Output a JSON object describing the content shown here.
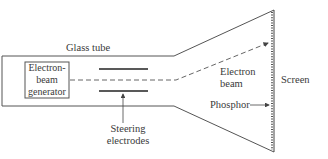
{
  "diagram": {
    "labels": {
      "glass_tube": "Glass tube",
      "generator_line1": "Electron-",
      "generator_line2": "beam",
      "generator_line3": "generator",
      "steering_line1": "Steering",
      "steering_line2": "electrodes",
      "beam_line1": "Electron",
      "beam_line2": "beam",
      "screen": "Screen",
      "phosphor": "Phosphor"
    },
    "colors": {
      "line": "#444444",
      "background": "#ffffff"
    }
  }
}
